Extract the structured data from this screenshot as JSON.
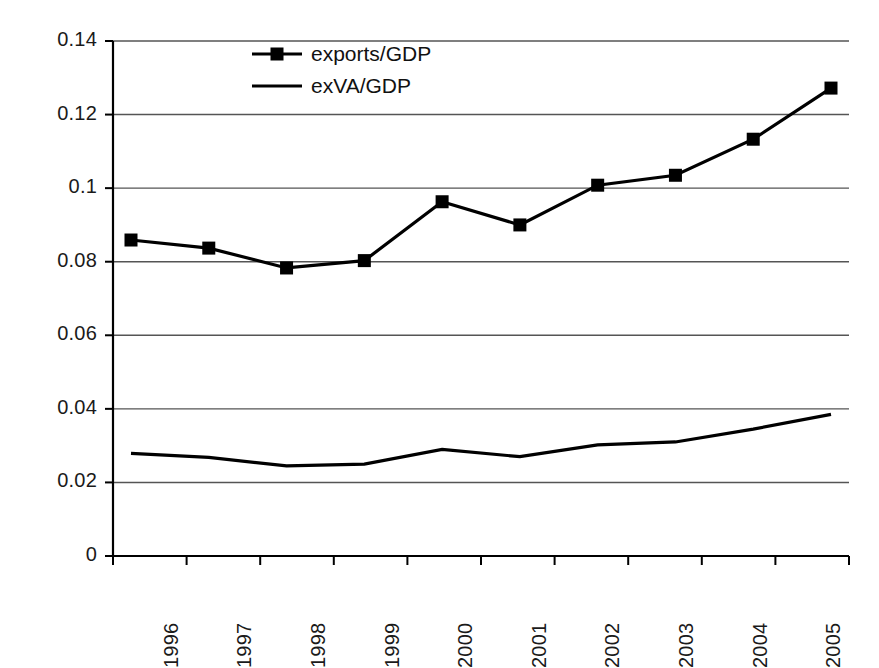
{
  "chart_data": {
    "type": "line",
    "title": "",
    "subtitle": "",
    "xlabel": "",
    "ylabel": "",
    "categories": [
      "1996",
      "1997",
      "1998",
      "1999",
      "2000",
      "2001",
      "2002",
      "2003",
      "2004",
      "2005"
    ],
    "series": [
      {
        "name": "exports/GDP",
        "marker": "filled-square",
        "color": "#000000",
        "values": [
          0.0859,
          0.0837,
          0.0783,
          0.0803,
          0.0963,
          0.09,
          0.1008,
          0.1035,
          0.1133,
          0.1272
        ]
      },
      {
        "name": "exVA/GDP",
        "marker": "none",
        "color": "#000000",
        "values": [
          0.0279,
          0.0268,
          0.0245,
          0.025,
          0.029,
          0.027,
          0.0302,
          0.031,
          0.0345,
          0.0385
        ]
      }
    ],
    "ylim": [
      0,
      0.14
    ],
    "yticks": [
      0,
      0.02,
      0.04,
      0.06,
      0.08,
      0.1,
      0.12,
      0.14
    ],
    "ytick_labels": [
      "0",
      "0.02",
      "0.04",
      "0.06",
      "0.08",
      "0.1",
      "0.12",
      "0.14"
    ],
    "grid": "horizontal",
    "grid_color": "#555555",
    "legend": {
      "position": "top-center",
      "entries": [
        {
          "label": "exports/GDP",
          "marker": "filled-square"
        },
        {
          "label": "exVA/GDP",
          "marker": "line"
        }
      ]
    },
    "axis_color": "#000000",
    "background": "#ffffff"
  }
}
